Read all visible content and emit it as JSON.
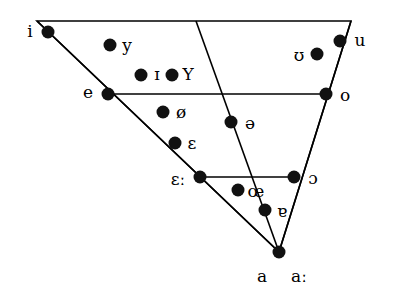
{
  "chart_data": {
    "type": "scatter",
    "title": "",
    "subtitle": "",
    "xlabel": "",
    "ylabel": "",
    "legend": [],
    "grid": false,
    "axis_ranges": {
      "x": [
        0,
        394
      ],
      "y": [
        0,
        302
      ]
    },
    "outline": {
      "name": "vowel-quadrilateral",
      "stroke": "#000000",
      "stroke_width": 1.6,
      "vertices": [
        {
          "name": "top-left",
          "x": 37,
          "y": 21
        },
        {
          "name": "top-right",
          "x": 351,
          "y": 21
        },
        {
          "name": "bottom-apex",
          "x": 279,
          "y": 252
        }
      ]
    },
    "internal_lines": [
      {
        "name": "close-mid-horizontal",
        "x1": 108,
        "y1": 94,
        "x2": 326,
        "y2": 94
      },
      {
        "name": "open-mid-horizontal",
        "x1": 200,
        "y1": 177,
        "x2": 294,
        "y2": 177
      },
      {
        "name": "front-diagonal",
        "x1": 37,
        "y1": 21,
        "x2": 279,
        "y2": 252
      },
      {
        "name": "central-diagonal",
        "x1": 196,
        "y1": 21,
        "x2": 279,
        "y2": 252
      },
      {
        "name": "back-diagonal",
        "x1": 351,
        "y1": 21,
        "x2": 279,
        "y2": 252
      }
    ],
    "points": [
      {
        "symbol": "i",
        "x": 48,
        "y": 32,
        "label_x": 30,
        "label_y": 31,
        "label_anchor": "left"
      },
      {
        "symbol": "y",
        "x": 110,
        "y": 45,
        "label_x": 127,
        "label_y": 45,
        "label_anchor": "right"
      },
      {
        "symbol": "ɪ",
        "x": 141,
        "y": 75,
        "label_x": 157,
        "label_y": 74,
        "label_anchor": "right"
      },
      {
        "symbol": "Y",
        "x": 172,
        "y": 75,
        "label_x": 188,
        "label_y": 74,
        "label_anchor": "right"
      },
      {
        "symbol": "ʊ",
        "x": 317,
        "y": 54,
        "label_x": 299,
        "label_y": 55,
        "label_anchor": "left"
      },
      {
        "symbol": "u",
        "x": 340,
        "y": 41,
        "label_x": 360,
        "label_y": 40,
        "label_anchor": "right"
      },
      {
        "symbol": "e",
        "x": 108,
        "y": 94,
        "label_x": 88,
        "label_y": 92,
        "label_anchor": "left"
      },
      {
        "symbol": "o",
        "x": 326,
        "y": 94,
        "label_x": 345,
        "label_y": 95,
        "label_anchor": "right"
      },
      {
        "symbol": "ø",
        "x": 163,
        "y": 112,
        "label_x": 181,
        "label_y": 112,
        "label_anchor": "right"
      },
      {
        "symbol": "ə",
        "x": 231,
        "y": 122,
        "label_x": 250,
        "label_y": 123,
        "label_anchor": "right"
      },
      {
        "symbol": "ɛ",
        "x": 175,
        "y": 143,
        "label_x": 192,
        "label_y": 143,
        "label_anchor": "right"
      },
      {
        "symbol": "ɛː",
        "x": 200,
        "y": 177,
        "label_x": 178,
        "label_y": 179,
        "label_anchor": "left"
      },
      {
        "symbol": "ɔ",
        "x": 294,
        "y": 177,
        "label_x": 313,
        "label_y": 178,
        "label_anchor": "right"
      },
      {
        "symbol": "œ",
        "x": 238,
        "y": 190,
        "label_x": 256,
        "label_y": 191,
        "label_anchor": "right"
      },
      {
        "symbol": "ɐ",
        "x": 265,
        "y": 210,
        "label_x": 282,
        "label_y": 211,
        "label_anchor": "right"
      },
      {
        "symbol": "a",
        "x": 279,
        "y": 252,
        "label_x": 262,
        "label_y": 276,
        "label_anchor": "below"
      },
      {
        "symbol": "aː",
        "x": null,
        "y": null,
        "label_x": 299,
        "label_y": 276,
        "label_anchor": "below"
      }
    ],
    "marker": {
      "shape": "circle",
      "radius": 6.5,
      "color": "#111111"
    }
  }
}
